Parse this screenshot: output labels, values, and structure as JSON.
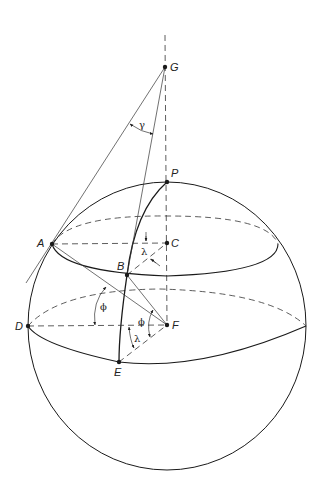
{
  "colors": {
    "ink": "#1a1a1a",
    "background": "#ffffff"
  },
  "points": {
    "G": {
      "label": "G",
      "x": 165,
      "y": 67
    },
    "P": {
      "label": "P",
      "x": 167,
      "y": 182
    },
    "A": {
      "label": "A",
      "x": 52,
      "y": 244
    },
    "C": {
      "label": "C",
      "x": 167,
      "y": 243
    },
    "B": {
      "label": "B",
      "x": 127,
      "y": 275
    },
    "D": {
      "label": "D",
      "x": 28,
      "y": 326
    },
    "F": {
      "label": "F",
      "x": 167,
      "y": 325
    },
    "E": {
      "label": "E",
      "x": 119,
      "y": 362
    }
  },
  "angles": {
    "gamma": "γ",
    "lambda_top": "λ",
    "phi_left": "ϕ",
    "phi_center": "ϕ",
    "lambda_bottom": "λ"
  },
  "sphere": {
    "cx": 167,
    "cy": 326,
    "rx": 139,
    "ry": 144
  }
}
